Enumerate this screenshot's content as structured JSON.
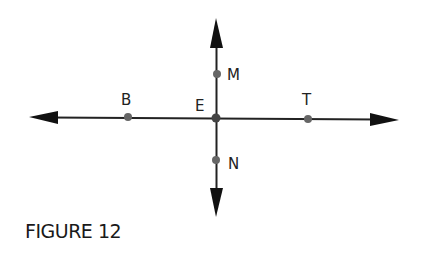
{
  "figure": {
    "caption": "FIGURE 12",
    "line_color": "#222222",
    "point_color": "#666666",
    "lines": [
      {
        "name": "horizontal-line",
        "from": [
          29,
          117
        ],
        "to": [
          399,
          120
        ]
      },
      {
        "name": "vertical-line",
        "from": [
          216,
          18
        ],
        "to": [
          216,
          217
        ]
      }
    ],
    "points": [
      {
        "label": "M",
        "x": 217,
        "y": 74
      },
      {
        "label": "B",
        "x": 128,
        "y": 117
      },
      {
        "label": "E",
        "x": 216,
        "y": 118
      },
      {
        "label": "T",
        "x": 308,
        "y": 119
      },
      {
        "label": "N",
        "x": 216,
        "y": 160
      }
    ]
  }
}
